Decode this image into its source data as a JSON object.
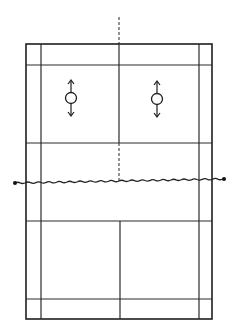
{
  "diagram": {
    "title": "",
    "colors": {
      "line": "#2a2a2a",
      "background": "#ffffff"
    },
    "court": {
      "outer": {
        "x1": 26,
        "y1": 44,
        "x2": 212,
        "y2": 319
      },
      "side_lines_inner": {
        "left_x": 41,
        "right_x": 199
      },
      "back_long_service_lines": {
        "top_y": 65,
        "bottom_y": 299
      },
      "short_service_lines": {
        "top_y": 143,
        "bottom_y": 221
      },
      "center_line_x": 119
    },
    "net": {
      "left_post": {
        "x": 15,
        "y": 183
      },
      "right_post": {
        "x": 224,
        "y": 179
      },
      "style": "wavy"
    },
    "extension_line": {
      "top": {
        "x": 119,
        "y1": 17,
        "y2": 44,
        "style": "dashed"
      },
      "center": {
        "x": 119,
        "y1": 143,
        "y2": 181,
        "style": "dashed"
      }
    },
    "players": [
      {
        "id": "player-left",
        "cx": 71,
        "cy": 98,
        "r": 5,
        "movement": "forward-backward"
      },
      {
        "id": "player-right",
        "cx": 157,
        "cy": 99,
        "r": 5,
        "movement": "forward-backward"
      }
    ]
  }
}
